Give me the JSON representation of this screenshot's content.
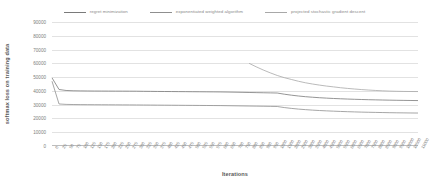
{
  "chart_data": {
    "type": "line",
    "title": "",
    "xlabel": "Iterations",
    "ylabel": "softmax loss on training data",
    "ylim": [
      0,
      90000
    ],
    "y_ticks": [
      0,
      10000,
      20000,
      30000,
      40000,
      50000,
      60000,
      70000,
      80000,
      90000
    ],
    "grid": true,
    "legend_position": "top-center",
    "categories": [
      "0",
      "25",
      "50",
      "75",
      "100",
      "125",
      "150",
      "175",
      "200",
      "225",
      "250",
      "275",
      "300",
      "325",
      "350",
      "375",
      "400",
      "425",
      "450",
      "475",
      "500",
      "525",
      "550",
      "575",
      "600",
      "650",
      "700",
      "750",
      "800",
      "850",
      "900",
      "950",
      "1000",
      "1500",
      "2000",
      "2500",
      "3000",
      "3500",
      "4000",
      "4500",
      "5000",
      "5500",
      "6000",
      "6500",
      "7000",
      "7500",
      "8000",
      "8500",
      "9000",
      "9500",
      "10000",
      "10500",
      "11000"
    ],
    "series": [
      {
        "name": "regret minimization",
        "color": "#7a7a7a",
        "values": [
          49500,
          41000,
          40300,
          40100,
          40000,
          39950,
          39900,
          39880,
          39860,
          39840,
          39820,
          39800,
          39780,
          39700,
          39650,
          39600,
          39560,
          39520,
          39480,
          39440,
          39400,
          39360,
          39320,
          39280,
          39240,
          39150,
          39050,
          38950,
          38850,
          38750,
          38650,
          38550,
          38450,
          37600,
          36900,
          36300,
          35800,
          35400,
          35050,
          34750,
          34500,
          34280,
          34080,
          33900,
          33740,
          33600,
          33480,
          33370,
          33270,
          33180,
          33100,
          33030,
          32970
        ]
      },
      {
        "name": "exponentiated weighted algorithm",
        "color": "#8f8f8f",
        "values": [
          47000,
          30500,
          30200,
          30100,
          30050,
          30010,
          29980,
          29950,
          29920,
          29890,
          29860,
          29830,
          29800,
          29760,
          29720,
          29680,
          29640,
          29600,
          29560,
          29520,
          29480,
          29440,
          29400,
          29360,
          29320,
          29240,
          29160,
          29080,
          29000,
          28920,
          28840,
          28760,
          28680,
          27900,
          27300,
          26800,
          26400,
          26050,
          25750,
          25500,
          25280,
          25080,
          24900,
          24740,
          24600,
          24480,
          24370,
          24270,
          24180,
          24100,
          24030,
          23970,
          23920
        ]
      },
      {
        "name": "projected stochastic gradient descent",
        "color": "#a8a8a8",
        "values": [
          null,
          null,
          null,
          null,
          null,
          null,
          null,
          null,
          null,
          null,
          null,
          null,
          null,
          null,
          null,
          null,
          null,
          null,
          null,
          null,
          null,
          null,
          null,
          null,
          null,
          null,
          null,
          null,
          60000,
          57500,
          55200,
          53100,
          51200,
          49600,
          48300,
          47000,
          45900,
          45000,
          44200,
          43500,
          42900,
          42300,
          41800,
          41350,
          40950,
          40600,
          40300,
          40050,
          39850,
          39700,
          39600,
          39550,
          39520
        ]
      }
    ]
  },
  "legend": {
    "items": [
      {
        "label": "regret minimization"
      },
      {
        "label": "exponentiated weighted algorithm"
      },
      {
        "label": "projected stochastic gradient descent"
      }
    ]
  },
  "axes": {
    "x_title": "Iterations",
    "y_title": "softmax loss on training data"
  }
}
